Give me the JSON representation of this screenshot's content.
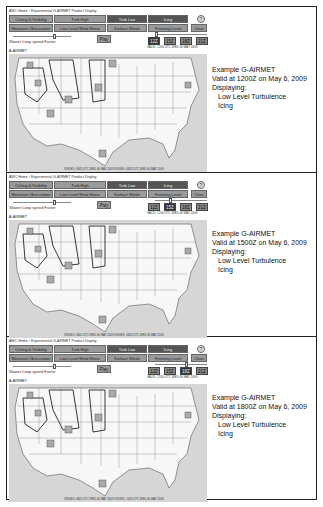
{
  "app": {
    "breadcrumb": "AWC Home › Experimental G-AIRMET Product Display",
    "row1": [
      "Ceiling & Visibility",
      "Turb High",
      "Turb Low",
      "Icing"
    ],
    "row2": [
      "Mountain Obscuration",
      "Low Level Wind Shear",
      "Surface Winds",
      "Freezing Level"
    ],
    "help_label": "?",
    "clear_label": "Clear",
    "speed_label": "Slower   Loop speed   Faster",
    "play_label": "Play",
    "times": [
      "12Z",
      "15Z",
      "18Z",
      "21Z"
    ],
    "valid_text": "VALID: 1200 UTC WED 06 MAY 2009",
    "map_label": "A-AIRMET",
    "active_layers": [
      "Turb Low",
      "Icing"
    ]
  },
  "panels": [
    {
      "selected_time": "12Z",
      "issued": "ISSUED: 0845 UTC WED 06 MAY 2009    ISSUED: 0845 UTC WED 06 MAY 2009",
      "description": {
        "title": "Example G-AIRMET",
        "valid": "Valid at 1200Z on May 6, 2009",
        "displaying": "Displaying:",
        "layers": [
          "Low Level Turbulence",
          "Icing"
        ]
      }
    },
    {
      "selected_time": "15Z",
      "issued": "ISSUED: 0845 UTC WED 06 MAY 2009    ISSUED: 0845 UTC WED 06 MAY 2009",
      "description": {
        "title": "Example G-AIRMET",
        "valid": "Valid at 1500Z on May 6, 2009",
        "displaying": "Displaying:",
        "layers": [
          "Low Level Turbulence",
          "Icing"
        ]
      }
    },
    {
      "selected_time": "18Z",
      "issued": "ISSUED: 0845 UTC WED 06 MAY 2009    ISSUED: 1445 UTC WED 06 MAY 2009",
      "description": {
        "title": "Example G-AIRMET",
        "valid": "Valid at 1800Z on May 6, 2009",
        "displaying": "Displaying:",
        "layers": [
          "Low Level Turbulence",
          "Icing"
        ]
      }
    }
  ]
}
